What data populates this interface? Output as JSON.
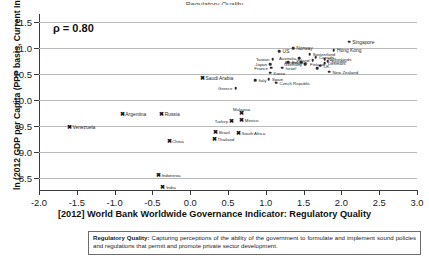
{
  "clipped_title": "Regulatory Quality",
  "chart_data": {
    "type": "scatter",
    "title": "",
    "xlabel": "[2012] World Bank Worldwide Governance Indicator: Regulatory Quality",
    "ylabel": "ln (2012 GDP per Capita (PPP basis, Current Intl $))",
    "xlim": [
      -2.0,
      3.0
    ],
    "ylim": [
      8.25,
      11.65
    ],
    "xticks": [
      "-2.0",
      "-1.5",
      "-1.0",
      "-0.5",
      "0.0",
      "0.5",
      "1.0",
      "1.5",
      "2.0",
      "2.5",
      "3.0"
    ],
    "xtick_values": [
      -2.0,
      -1.5,
      -1.0,
      -0.5,
      0.0,
      0.5,
      1.0,
      1.5,
      2.0,
      2.5,
      3.0
    ],
    "yticks": [
      "8.5",
      "9.0",
      "9.5",
      "10.0",
      "10.5",
      "11.0",
      "11.5"
    ],
    "ytick_values": [
      8.5,
      9.0,
      9.5,
      10.0,
      10.5,
      11.0,
      11.5
    ],
    "grid": "horizontal",
    "annotation": "ρ = 0.80",
    "correlation": 0.8,
    "legend": "none",
    "series": [
      {
        "name": "Advanced economies",
        "marker": "circle",
        "points": [
          {
            "label": "Singapore",
            "x": 2.1,
            "y": 11.12,
            "lbl_pos": "r"
          },
          {
            "label": "Hong Kong",
            "x": 1.9,
            "y": 10.95,
            "lbl_pos": "r"
          },
          {
            "label": "Norway",
            "x": 1.36,
            "y": 10.99,
            "lbl_pos": "r"
          },
          {
            "label": "US",
            "x": 1.18,
            "y": 10.94,
            "lbl_pos": "r"
          },
          {
            "label": "Switzerland",
            "x": 1.58,
            "y": 10.88,
            "lbl_pos": "r"
          },
          {
            "label": "Netherlands",
            "x": 1.78,
            "y": 10.78,
            "lbl_pos": "r"
          },
          {
            "label": "Canada",
            "x": 1.66,
            "y": 10.82,
            "lbl_pos": "r"
          },
          {
            "label": "Australia",
            "x": 1.44,
            "y": 10.8,
            "lbl_pos": "l"
          },
          {
            "label": "Ireland",
            "x": 1.62,
            "y": 10.76,
            "lbl_pos": "l"
          },
          {
            "label": "Sweden",
            "x": 1.82,
            "y": 10.74,
            "lbl_pos": "r"
          },
          {
            "label": "Denmark",
            "x": 1.78,
            "y": 10.7,
            "lbl_pos": "r"
          },
          {
            "label": "Germany",
            "x": 1.52,
            "y": 10.68,
            "lbl_pos": "l"
          },
          {
            "label": "Austria",
            "x": 1.47,
            "y": 10.72,
            "lbl_pos": "l"
          },
          {
            "label": "Belgium",
            "x": 1.3,
            "y": 10.72,
            "lbl_pos": "r"
          },
          {
            "label": "UK",
            "x": 1.72,
            "y": 10.66,
            "lbl_pos": "r"
          },
          {
            "label": "Finland",
            "x": 1.68,
            "y": 10.61,
            "lbl_pos": "c"
          },
          {
            "label": "New Zealand",
            "x": 1.84,
            "y": 10.54,
            "lbl_pos": "r"
          },
          {
            "label": "Taiwan",
            "x": 1.09,
            "y": 10.78,
            "lbl_pos": "l"
          },
          {
            "label": "Japan",
            "x": 1.06,
            "y": 10.69,
            "lbl_pos": "l"
          },
          {
            "label": "France",
            "x": 1.07,
            "y": 10.62,
            "lbl_pos": "l"
          },
          {
            "label": "Israel",
            "x": 1.22,
            "y": 10.62,
            "lbl_pos": "r"
          },
          {
            "label": "Korea",
            "x": 1.06,
            "y": 10.52,
            "lbl_pos": "r"
          },
          {
            "label": "Spain",
            "x": 1.04,
            "y": 10.4,
            "lbl_pos": "r"
          },
          {
            "label": "Italy",
            "x": 0.86,
            "y": 10.38,
            "lbl_pos": "r"
          },
          {
            "label": "Czech Republic",
            "x": 1.14,
            "y": 10.33,
            "lbl_pos": "r"
          },
          {
            "label": "Greece",
            "x": 0.6,
            "y": 10.22,
            "lbl_pos": "l"
          }
        ]
      },
      {
        "name": "Emerging economies",
        "marker": "x",
        "points": [
          {
            "label": "Saudi Arabia",
            "x": 0.16,
            "y": 10.42,
            "lbl_pos": "r"
          },
          {
            "label": "Malaysia",
            "x": 0.68,
            "y": 9.74,
            "lbl_pos": "c"
          },
          {
            "label": "Mexico",
            "x": 0.68,
            "y": 9.62,
            "lbl_pos": "r"
          },
          {
            "label": "Turkey",
            "x": 0.54,
            "y": 9.6,
            "lbl_pos": "l"
          },
          {
            "label": "Russia",
            "x": -0.38,
            "y": 9.72,
            "lbl_pos": "r"
          },
          {
            "label": "Argentina",
            "x": -0.9,
            "y": 9.72,
            "lbl_pos": "r"
          },
          {
            "label": "Venezuela",
            "x": -1.6,
            "y": 9.48,
            "lbl_pos": "r"
          },
          {
            "label": "Brazil",
            "x": 0.34,
            "y": 9.38,
            "lbl_pos": "r"
          },
          {
            "label": "South Africa",
            "x": 0.64,
            "y": 9.36,
            "lbl_pos": "r"
          },
          {
            "label": "Thailand",
            "x": 0.32,
            "y": 9.25,
            "lbl_pos": "r"
          },
          {
            "label": "China",
            "x": -0.28,
            "y": 9.22,
            "lbl_pos": "r"
          },
          {
            "label": "Indonesia",
            "x": -0.42,
            "y": 8.56,
            "lbl_pos": "r"
          },
          {
            "label": "India",
            "x": -0.36,
            "y": 8.33,
            "lbl_pos": "r"
          }
        ]
      }
    ]
  },
  "caption": {
    "term": "Regulatory Quality",
    "separator": ":",
    "text": " Capturing perceptions of the ability of the government to formulate and implement sound policies and regulations that permit and promote private sector development."
  }
}
